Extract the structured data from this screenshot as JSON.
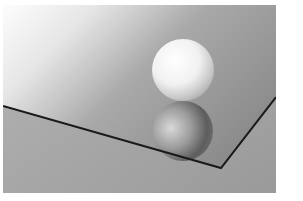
{
  "image": {
    "description": "3D render of a white sphere resting on a reflective mirror plane with its reflection",
    "subjects": [
      "white sphere",
      "sphere reflection",
      "mirror plane",
      "dark mirror edge"
    ],
    "colors": {
      "background_light": "#fbfbfb",
      "background_mid": "#b9b9b9",
      "background_dark": "#8e8e8e",
      "floor": "#a3a3a3",
      "edge": "#1a1a1a",
      "sphere_highlight": "#ffffff",
      "sphere_shadow": "#b0b0b0"
    }
  }
}
